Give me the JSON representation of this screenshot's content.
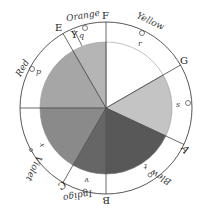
{
  "diagram": {
    "center": [
      106,
      108
    ],
    "outer_radius": 86,
    "inner_radius": 66,
    "points": {
      "F": "F",
      "G": "G",
      "A": "A",
      "B": "B",
      "C": "C",
      "D": "D",
      "E": "E",
      "Y": "Y"
    },
    "color_labels": {
      "orange": "Orange",
      "yellow": "Yellow",
      "red": "Red",
      "violet": "Violet",
      "indigo": "Indigo",
      "blue": "Blew"
    },
    "centers_of_gravity": {
      "p": "p",
      "q": "q",
      "r": "r",
      "s": "s",
      "t": "t",
      "v": "v",
      "x": "x"
    },
    "segments": [
      {
        "name": "yellow",
        "fill": "#ffffff"
      },
      {
        "name": "green",
        "fill": "#c4c4c4"
      },
      {
        "name": "blue",
        "fill": "#585858"
      },
      {
        "name": "indigo",
        "fill": "#6c6c6c"
      },
      {
        "name": "violet",
        "fill": "#8a8a8a"
      },
      {
        "name": "red",
        "fill": "#a6a6a6"
      },
      {
        "name": "orange",
        "fill": "#b4b4b4"
      }
    ]
  }
}
